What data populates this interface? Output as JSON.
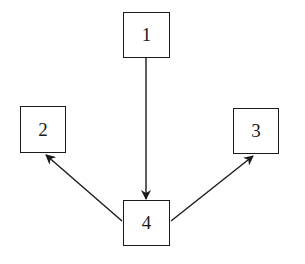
{
  "diagram": {
    "colors": {
      "stroke": "#1a1a1a",
      "background": "#ffffff"
    },
    "nodes": [
      {
        "id": "1",
        "label": "1",
        "x": 123,
        "y": 12,
        "w": 47,
        "h": 46
      },
      {
        "id": "2",
        "label": "2",
        "x": 20,
        "y": 106,
        "w": 46,
        "h": 47
      },
      {
        "id": "3",
        "label": "3",
        "x": 233,
        "y": 108,
        "w": 46,
        "h": 46
      },
      {
        "id": "4",
        "label": "4",
        "x": 123,
        "y": 200,
        "w": 47,
        "h": 46
      }
    ],
    "edges": [
      {
        "from": "1",
        "to": "4"
      },
      {
        "from": "4",
        "to": "2"
      },
      {
        "from": "4",
        "to": "3"
      }
    ]
  }
}
